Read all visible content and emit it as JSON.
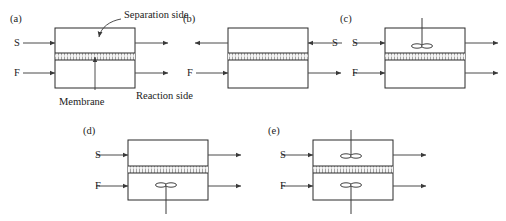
{
  "figure": {
    "stroke_color": "#2a2a2a",
    "background": "#ffffff",
    "membrane_fill": "#f2f2f2"
  },
  "annotations": {
    "separation_side": "Separation side",
    "reaction_side": "Reaction side",
    "membrane": "Membrane"
  },
  "streams": {
    "sweep": "S",
    "feed": "F"
  },
  "panels": [
    {
      "id": "a",
      "label": "(a)",
      "box": {
        "x": 55,
        "y": 28,
        "w": 80,
        "h": 60
      },
      "membrane": {
        "y": 53,
        "h": 7
      },
      "inlets": [
        {
          "name": "sweep-inlet",
          "stream": "S",
          "side": "left",
          "y": 43,
          "label_x": 14,
          "label_y": 46
        },
        {
          "name": "feed-inlet",
          "stream": "F",
          "side": "left",
          "y": 73,
          "label_x": 14,
          "label_y": 76
        }
      ],
      "outlets": [
        {
          "name": "separation-outlet",
          "side": "right",
          "y": 43
        },
        {
          "name": "reaction-outlet",
          "side": "right",
          "y": 73
        }
      ],
      "spargers": []
    },
    {
      "id": "b",
      "label": "(b)",
      "box": {
        "x": 228,
        "y": 28,
        "w": 80,
        "h": 60
      },
      "membrane": {
        "y": 53,
        "h": 7
      },
      "inlets": [
        {
          "name": "sweep-inlet",
          "stream": "S",
          "side": "right",
          "y": 43,
          "label_x": 332,
          "label_y": 46
        },
        {
          "name": "feed-inlet",
          "stream": "F",
          "side": "left",
          "y": 73,
          "label_x": 187,
          "label_y": 76
        }
      ],
      "outlets": [
        {
          "name": "separation-outlet",
          "side": "left",
          "y": 43
        },
        {
          "name": "reaction-outlet",
          "side": "right",
          "y": 73
        }
      ],
      "spargers": []
    },
    {
      "id": "c",
      "label": "(c)",
      "box": {
        "x": 385,
        "y": 28,
        "w": 80,
        "h": 60
      },
      "membrane": {
        "y": 53,
        "h": 7
      },
      "inlets": [
        {
          "name": "sweep-inlet",
          "stream": "S",
          "side": "left",
          "y": 43,
          "label_x": 352,
          "label_y": 46
        },
        {
          "name": "feed-inlet",
          "stream": "F",
          "side": "left",
          "y": 73,
          "label_x": 352,
          "label_y": 76
        }
      ],
      "outlets": [
        {
          "name": "separation-outlet",
          "side": "right",
          "y": 43
        },
        {
          "name": "reaction-outlet",
          "side": "right",
          "y": 73
        }
      ],
      "spargers": [
        {
          "name": "upper-sparger",
          "cx": 422,
          "cy": 46,
          "stem_dir": "up",
          "stem_to": 18
        }
      ]
    },
    {
      "id": "d",
      "label": "(d)",
      "box": {
        "x": 128,
        "y": 140,
        "w": 80,
        "h": 60
      },
      "membrane": {
        "y": 166,
        "h": 7
      },
      "inlets": [
        {
          "name": "sweep-inlet",
          "stream": "S",
          "side": "left",
          "y": 155,
          "label_x": 95,
          "label_y": 158
        },
        {
          "name": "feed-inlet",
          "stream": "F",
          "side": "left",
          "y": 186,
          "label_x": 95,
          "label_y": 189
        }
      ],
      "outlets": [
        {
          "name": "separation-outlet",
          "side": "right",
          "y": 155
        },
        {
          "name": "reaction-outlet",
          "side": "right",
          "y": 186
        }
      ],
      "spargers": [
        {
          "name": "lower-sparger",
          "cx": 166,
          "cy": 185,
          "stem_dir": "down",
          "stem_to": 214
        }
      ]
    },
    {
      "id": "e",
      "label": "(e)",
      "box": {
        "x": 313,
        "y": 140,
        "w": 80,
        "h": 60
      },
      "membrane": {
        "y": 166,
        "h": 7
      },
      "inlets": [
        {
          "name": "sweep-inlet",
          "stream": "S",
          "side": "left",
          "y": 155,
          "label_x": 280,
          "label_y": 158
        },
        {
          "name": "feed-inlet",
          "stream": "F",
          "side": "left",
          "y": 186,
          "label_x": 280,
          "label_y": 189
        }
      ],
      "outlets": [
        {
          "name": "separation-outlet",
          "side": "right",
          "y": 155
        },
        {
          "name": "reaction-outlet",
          "side": "right",
          "y": 186
        }
      ],
      "spargers": [
        {
          "name": "upper-sparger",
          "cx": 351,
          "cy": 156,
          "stem_dir": "up",
          "stem_to": 130
        },
        {
          "name": "lower-sparger",
          "cx": 351,
          "cy": 185,
          "stem_dir": "down",
          "stem_to": 214
        }
      ]
    }
  ]
}
